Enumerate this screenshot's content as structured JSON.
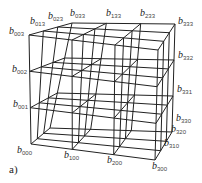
{
  "figure": {
    "caption": "a)",
    "grid_divisions": 3,
    "line_color": "#222222",
    "geometry": {
      "front_face": {
        "b000": [
          31,
          144
        ],
        "b300": [
          155,
          160
        ],
        "b003": [
          29,
          35
        ],
        "b303": [
          158,
          50
        ]
      },
      "back_face": {
        "b030": [
          50,
          128
        ],
        "b330": [
          172,
          132
        ],
        "b033": [
          72,
          23
        ],
        "b333": [
          175,
          24
        ]
      }
    },
    "labels": [
      {
        "id": "b003",
        "base": "b",
        "sub": "003",
        "x": 9,
        "y": 26
      },
      {
        "id": "b013",
        "base": "b",
        "sub": "013",
        "x": 30,
        "y": 16
      },
      {
        "id": "b023",
        "base": "b",
        "sub": "023",
        "x": 48,
        "y": 11
      },
      {
        "id": "b033",
        "base": "b",
        "sub": "033",
        "x": 70,
        "y": 8
      },
      {
        "id": "b133",
        "base": "b",
        "sub": "133",
        "x": 106,
        "y": 8
      },
      {
        "id": "b233",
        "base": "b",
        "sub": "233",
        "x": 140,
        "y": 8
      },
      {
        "id": "b333",
        "base": "b",
        "sub": "333",
        "x": 178,
        "y": 16
      },
      {
        "id": "b002",
        "base": "b",
        "sub": "002",
        "x": 12,
        "y": 64
      },
      {
        "id": "b332",
        "base": "b",
        "sub": "332",
        "x": 178,
        "y": 50
      },
      {
        "id": "b001",
        "base": "b",
        "sub": "001",
        "x": 13,
        "y": 99
      },
      {
        "id": "b331",
        "base": "b",
        "sub": "331",
        "x": 177,
        "y": 84
      },
      {
        "id": "b330",
        "base": "b",
        "sub": "330",
        "x": 176,
        "y": 113
      },
      {
        "id": "b320",
        "base": "b",
        "sub": "320",
        "x": 171,
        "y": 124
      },
      {
        "id": "b310",
        "base": "b",
        "sub": "310",
        "x": 164,
        "y": 138
      },
      {
        "id": "b000",
        "base": "b",
        "sub": "000",
        "x": 17,
        "y": 145
      },
      {
        "id": "b100",
        "base": "b",
        "sub": "100",
        "x": 64,
        "y": 150
      },
      {
        "id": "b200",
        "base": "b",
        "sub": "200",
        "x": 107,
        "y": 155
      },
      {
        "id": "b300",
        "base": "b",
        "sub": "300",
        "x": 152,
        "y": 161
      }
    ]
  }
}
